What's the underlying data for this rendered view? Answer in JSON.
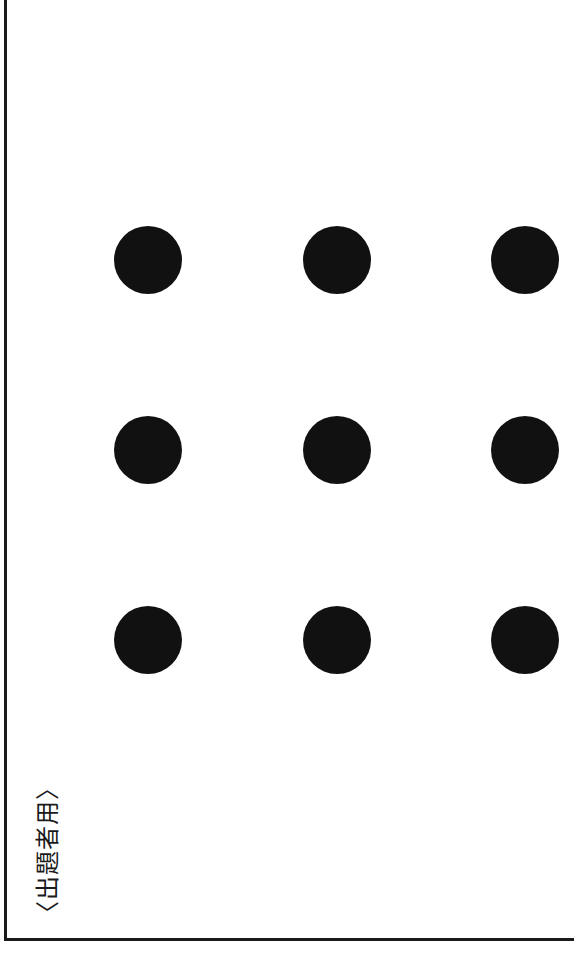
{
  "sheet": {
    "label": "〈出題者用〉",
    "label_orientation": "rotated -90deg",
    "border_color": "#1a1a1a"
  },
  "dot_grid": {
    "rows": 3,
    "cols": 3,
    "dot_color": "#111111",
    "dot_diameter_px": 68,
    "dots": [
      {
        "row": 1,
        "col": 1,
        "cx": 148,
        "cy": 260
      },
      {
        "row": 1,
        "col": 2,
        "cx": 337,
        "cy": 260
      },
      {
        "row": 1,
        "col": 3,
        "cx": 525,
        "cy": 260
      },
      {
        "row": 2,
        "col": 1,
        "cx": 148,
        "cy": 450
      },
      {
        "row": 2,
        "col": 2,
        "cx": 337,
        "cy": 450
      },
      {
        "row": 2,
        "col": 3,
        "cx": 525,
        "cy": 450
      },
      {
        "row": 3,
        "col": 1,
        "cx": 148,
        "cy": 640
      },
      {
        "row": 3,
        "col": 2,
        "cx": 337,
        "cy": 640
      },
      {
        "row": 3,
        "col": 3,
        "cx": 525,
        "cy": 640
      }
    ]
  }
}
